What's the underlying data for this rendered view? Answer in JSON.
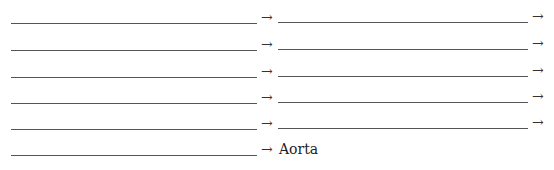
{
  "worksheet": {
    "title": "Blood flow sequence fill-in",
    "arrow_glyph": "→",
    "rows": [
      {
        "left_blank": "",
        "right_blank": "",
        "has_right_blank": true
      },
      {
        "left_blank": "",
        "right_blank": "",
        "has_right_blank": true
      },
      {
        "left_blank": "",
        "right_blank": "",
        "has_right_blank": true
      },
      {
        "left_blank": "",
        "right_blank": "",
        "has_right_blank": true
      },
      {
        "left_blank": "",
        "right_blank": "",
        "has_right_blank": true
      },
      {
        "left_blank": "",
        "final_text": "Aorta",
        "has_right_blank": false
      }
    ]
  }
}
